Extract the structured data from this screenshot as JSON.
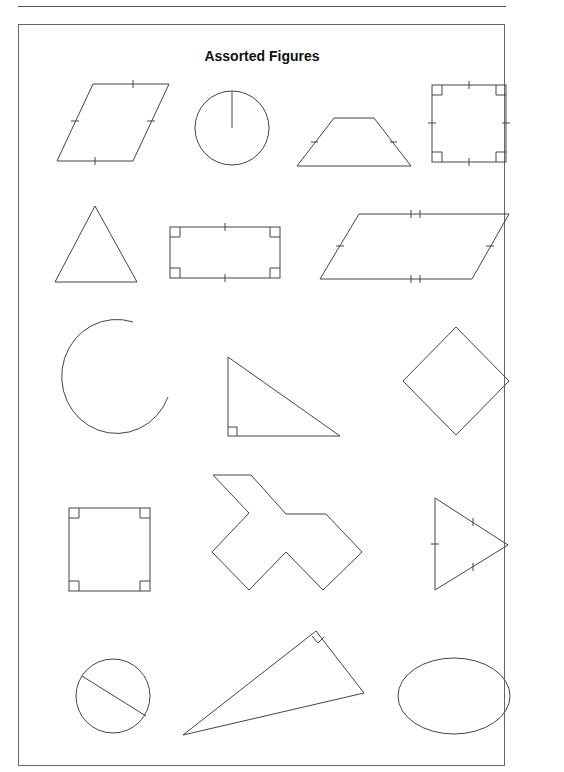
{
  "page": {
    "title": "Assorted Figures"
  },
  "figures": [
    {
      "id": "parallelogram-congruent",
      "label": "parallelogram with equal-side tick marks"
    },
    {
      "id": "circle-radius",
      "label": "circle with radius"
    },
    {
      "id": "isosceles-trapezoid",
      "label": "isosceles trapezoid"
    },
    {
      "id": "square-ticks",
      "label": "square with right angles and tick marks"
    },
    {
      "id": "triangle",
      "label": "equilateral-looking triangle"
    },
    {
      "id": "rectangle",
      "label": "rectangle with right angles"
    },
    {
      "id": "parallelogram-double-ticks",
      "label": "parallelogram with double tick marks"
    },
    {
      "id": "open-arc",
      "label": "open arc (C shape)"
    },
    {
      "id": "right-triangle",
      "label": "right triangle"
    },
    {
      "id": "rhombus",
      "label": "rhombus / rotated square"
    },
    {
      "id": "square-right-angles",
      "label": "square with right angles"
    },
    {
      "id": "irregular-polygon",
      "label": "irregular decagon"
    },
    {
      "id": "isosceles-triangle",
      "label": "isosceles triangle with tick marks"
    },
    {
      "id": "circle-diameter",
      "label": "circle with diameter"
    },
    {
      "id": "right-triangle-rotated",
      "label": "rotated right triangle"
    },
    {
      "id": "ellipse",
      "label": "ellipse"
    }
  ]
}
